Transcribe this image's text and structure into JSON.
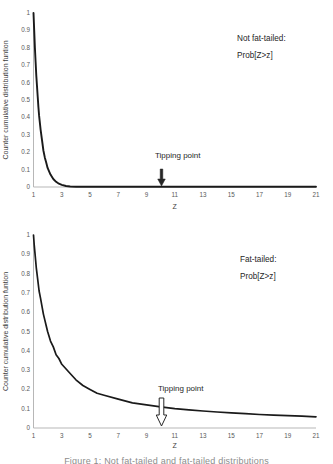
{
  "caption": "Figure 1: Not fat-tailed and fat-tailed distributions",
  "style": {
    "background": "#ffffff",
    "axis_line": "#b7b7b7",
    "tick_text": "#595959",
    "axis_label_text": "#404040",
    "curve": "#1a1a1a",
    "annotation_text": "#262626",
    "arrow_fill_top": "#262626",
    "arrow_fill_bottom": "#ffffff",
    "caption_text": "#8c8c8c"
  },
  "chart_data": [
    {
      "type": "line",
      "name": "not-fat-tailed",
      "title": "Not fat-tailed: Prob[Z>z]",
      "annotation": [
        "Not fat-tailed:",
        "Prob[Z>z]"
      ],
      "tipping_point_label": "Tipping point",
      "tipping_point_x": 10,
      "arrow_style": "filled",
      "xlabel": "Z",
      "ylabel": "Counter cumulative distribution funtion",
      "xlim": [
        1,
        21
      ],
      "ylim": [
        0,
        1
      ],
      "xticks": [
        1,
        3,
        5,
        7,
        9,
        11,
        13,
        15,
        17,
        19,
        21
      ],
      "yticks": [
        1,
        0.9,
        0.8,
        0.7,
        0.6,
        0.5,
        0.4,
        0.3,
        0.2,
        0.1,
        0
      ],
      "grid": false,
      "legend": "none",
      "points": [
        [
          1,
          1
        ],
        [
          1.05,
          0.9
        ],
        [
          1.1,
          0.8
        ],
        [
          1.15,
          0.72
        ],
        [
          1.2,
          0.64
        ],
        [
          1.25,
          0.58
        ],
        [
          1.3,
          0.52
        ],
        [
          1.35,
          0.46
        ],
        [
          1.4,
          0.41
        ],
        [
          1.5,
          0.33
        ],
        [
          1.6,
          0.27
        ],
        [
          1.7,
          0.21
        ],
        [
          1.8,
          0.17
        ],
        [
          1.9,
          0.14
        ],
        [
          2,
          0.11
        ],
        [
          2.2,
          0.071
        ],
        [
          2.4,
          0.046
        ],
        [
          2.6,
          0.03
        ],
        [
          2.8,
          0.019
        ],
        [
          3,
          0.012
        ],
        [
          3.3,
          0.006
        ],
        [
          3.6,
          0.003
        ],
        [
          4,
          0.002
        ],
        [
          4.5,
          0.001
        ],
        [
          5,
          0.001
        ],
        [
          6,
          0.001
        ],
        [
          8,
          0.001
        ],
        [
          10,
          0.001
        ],
        [
          12,
          0.001
        ],
        [
          14,
          0.001
        ],
        [
          16,
          0.001
        ],
        [
          18,
          0.001
        ],
        [
          21,
          0.001
        ]
      ]
    },
    {
      "type": "line",
      "name": "fat-tailed",
      "title": "Fat-tailed: Prob[Z>z]",
      "annotation": [
        "Fat-tailed:",
        "Prob[Z>z]"
      ],
      "tipping_point_label": "Tipping point",
      "tipping_point_x": 10,
      "arrow_style": "hollow",
      "xlabel": "Z",
      "ylabel": "Counter cumulative distribution funtion",
      "xlim": [
        1,
        21
      ],
      "ylim": [
        0,
        1
      ],
      "xticks": [
        1,
        3,
        5,
        7,
        9,
        11,
        13,
        15,
        17,
        19,
        21
      ],
      "yticks": [
        1,
        0.9,
        0.8,
        0.7,
        0.6,
        0.5,
        0.4,
        0.3,
        0.2,
        0.1,
        0
      ],
      "grid": false,
      "legend": "none",
      "points": [
        [
          1,
          1
        ],
        [
          1.05,
          0.95
        ],
        [
          1.1,
          0.91
        ],
        [
          1.15,
          0.87
        ],
        [
          1.2,
          0.83
        ],
        [
          1.25,
          0.8
        ],
        [
          1.3,
          0.77
        ],
        [
          1.4,
          0.71
        ],
        [
          1.5,
          0.67
        ],
        [
          1.6,
          0.63
        ],
        [
          1.7,
          0.59
        ],
        [
          1.8,
          0.56
        ],
        [
          1.9,
          0.53
        ],
        [
          2,
          0.5
        ],
        [
          2.2,
          0.45
        ],
        [
          2.4,
          0.42
        ],
        [
          2.6,
          0.38
        ],
        [
          2.8,
          0.36
        ],
        [
          3,
          0.33
        ],
        [
          3.5,
          0.29
        ],
        [
          4,
          0.25
        ],
        [
          4.5,
          0.22
        ],
        [
          5,
          0.2
        ],
        [
          5.5,
          0.18
        ],
        [
          6,
          0.17
        ],
        [
          7,
          0.15
        ],
        [
          8,
          0.13
        ],
        [
          9,
          0.12
        ],
        [
          10,
          0.11
        ],
        [
          11,
          0.1
        ],
        [
          12,
          0.094
        ],
        [
          13,
          0.088
        ],
        [
          14,
          0.083
        ],
        [
          15,
          0.078
        ],
        [
          16,
          0.074
        ],
        [
          17,
          0.07
        ],
        [
          18,
          0.067
        ],
        [
          19,
          0.064
        ],
        [
          20,
          0.061
        ],
        [
          21,
          0.058
        ]
      ]
    }
  ]
}
